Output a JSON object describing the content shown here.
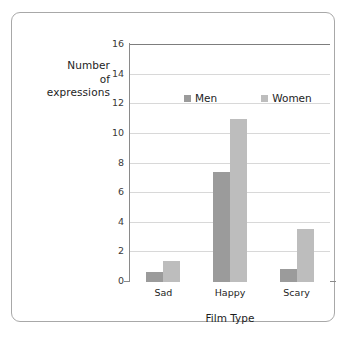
{
  "chart_data": {
    "type": "bar",
    "title": "",
    "xlabel": "Film Type",
    "ylabel": "Number of expressions",
    "ylabel_lines": [
      "Number",
      "of",
      "expressions"
    ],
    "categories": [
      "Sad",
      "Happy",
      "Scary"
    ],
    "series": [
      {
        "name": "Men",
        "color": "#9b9b9b",
        "values": [
          0.7,
          7.4,
          0.9
        ]
      },
      {
        "name": "Women",
        "color": "#bdbdbd",
        "values": [
          1.4,
          11.0,
          3.6
        ]
      }
    ],
    "ylim": [
      0,
      16
    ],
    "ytick_labels": [
      "0",
      "2",
      "4",
      "6",
      "8",
      "10",
      "12",
      "14",
      "16"
    ],
    "ytick_values": [
      0,
      2,
      4,
      6,
      8,
      10,
      12,
      14,
      16
    ],
    "grid": true,
    "legend_position": "inside-top-center",
    "legend_entries": [
      "Men",
      "Women"
    ]
  },
  "frame": {
    "border_color": "#a8a8a8",
    "background": "#ffffff"
  }
}
